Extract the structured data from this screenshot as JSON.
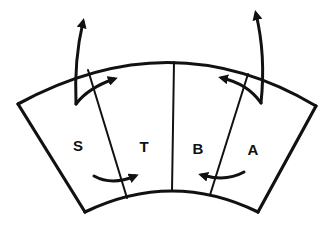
{
  "diagram": {
    "type": "segmented-arc-block",
    "stroke_color": "#111111",
    "background": "#ffffff",
    "segments": [
      {
        "id": "S",
        "label": "S"
      },
      {
        "id": "T",
        "label": "T"
      },
      {
        "id": "B",
        "label": "B"
      },
      {
        "id": "A",
        "label": "A"
      }
    ],
    "arrows": [
      {
        "name": "left-outward-arrow",
        "description": "curved arrow from segment S up and out past outer arc"
      },
      {
        "name": "left-hook-arrow",
        "description": "hooked arrow crossing S/T divider pointing right at top"
      },
      {
        "name": "left-bottom-arrow",
        "description": "curved arrow from S into T near inner arc"
      },
      {
        "name": "right-outward-arrow",
        "description": "curved arrow from segment A up and out past outer arc"
      },
      {
        "name": "right-hook-arrow",
        "description": "hooked arrow crossing B/A divider pointing left at top"
      },
      {
        "name": "right-bottom-arrow",
        "description": "curved arrow from A into B near inner arc"
      }
    ]
  }
}
